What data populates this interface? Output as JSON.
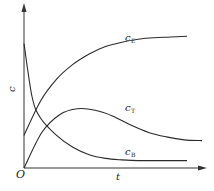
{
  "chart_data": {
    "type": "line",
    "title": "",
    "xlabel": "t",
    "ylabel": "c",
    "origin_label": "O",
    "grid": false,
    "legend": "inline labels",
    "ticks": {
      "x": [],
      "y": []
    },
    "series": [
      {
        "name": "cE",
        "label_main": "c",
        "label_sub": "E",
        "shape": "monotonic rising, saturating",
        "x": [
          0,
          0.1,
          0.2,
          0.3,
          0.4,
          0.5,
          0.6,
          0.7,
          0.8,
          0.9,
          1.0
        ],
        "values": [
          0.22,
          0.45,
          0.6,
          0.7,
          0.77,
          0.82,
          0.85,
          0.87,
          0.88,
          0.885,
          0.89
        ]
      },
      {
        "name": "cT",
        "label_main": "c",
        "label_sub": "T",
        "shape": "rises to maximum then decays",
        "x": [
          0,
          0.1,
          0.2,
          0.3,
          0.4,
          0.5,
          0.6,
          0.7,
          0.8,
          0.9,
          1.0
        ],
        "values": [
          0.0,
          0.24,
          0.36,
          0.4,
          0.39,
          0.35,
          0.29,
          0.24,
          0.21,
          0.19,
          0.185
        ]
      },
      {
        "name": "cB",
        "label_main": "c",
        "label_sub": "B",
        "shape": "monotonic decay to low plateau",
        "x": [
          0,
          0.05,
          0.1,
          0.2,
          0.3,
          0.4,
          0.5,
          0.6,
          0.7,
          0.8,
          0.9,
          1.0
        ],
        "values": [
          0.84,
          0.48,
          0.34,
          0.22,
          0.14,
          0.09,
          0.065,
          0.055,
          0.05,
          0.05,
          0.05,
          0.05
        ]
      }
    ],
    "colors": {
      "line": "#2a2a2a",
      "axis": "#333333",
      "background": "#ffffff"
    }
  }
}
